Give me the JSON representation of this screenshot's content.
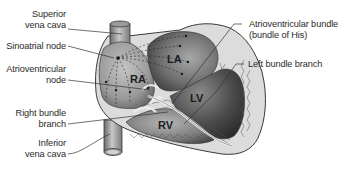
{
  "diagram": {
    "labels_left": [
      {
        "id": "superior-vena-cava",
        "line1": "Superior",
        "line2": "vena cava"
      },
      {
        "id": "sinoatrial-node",
        "line1": "Sinoatrial node",
        "line2": ""
      },
      {
        "id": "atrioventricular-node",
        "line1": "Atrioventricular",
        "line2": "node"
      },
      {
        "id": "right-bundle-branch",
        "line1": "Right bundle",
        "line2": "branch"
      },
      {
        "id": "inferior-vena-cava",
        "line1": "Inferior",
        "line2": "vena cava"
      }
    ],
    "labels_right": [
      {
        "id": "atrioventricular-bundle",
        "line1": "Atrioventricular bundle",
        "line2": "(bundle of His)"
      },
      {
        "id": "left-bundle-branch",
        "line1": "Left bundle branch",
        "line2": ""
      }
    ],
    "chambers": {
      "ra": "RA",
      "la": "LA",
      "lv": "LV",
      "rv": "RV"
    },
    "colors": {
      "outline": "#3a3a3a",
      "wall": "#d8d8d8",
      "chamber_dark": "#3c3c3c",
      "chamber_light": "#b8b8b8",
      "text": "#2a2a2a",
      "leader": "#333333"
    }
  }
}
